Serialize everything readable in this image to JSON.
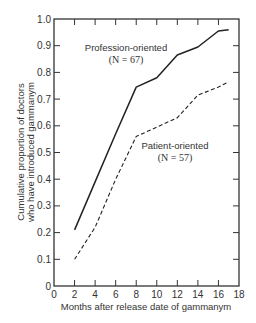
{
  "chart_data": {
    "type": "line",
    "title": "",
    "xlabel": "Months after release date of gammanym",
    "ylabel_lines": [
      "Cumulative proportion of doctors",
      "who have introduced gammanym"
    ],
    "ylabel": "Cumulative proportion of doctors who have introduced gammanym",
    "xlim": [
      0,
      18
    ],
    "ylim": [
      0,
      1.0
    ],
    "xticks": [
      0,
      2,
      4,
      6,
      8,
      10,
      12,
      14,
      16,
      18
    ],
    "xtick_labels": [
      "0",
      "2",
      "4",
      "6",
      "8",
      "10",
      "12",
      "14",
      "16",
      "18"
    ],
    "yticks": [
      0,
      0.1,
      0.2,
      0.3,
      0.4,
      0.5,
      0.6,
      0.7,
      0.8,
      0.9,
      1.0
    ],
    "ytick_labels": [
      "0",
      "0.1",
      "0.2",
      "0.3",
      "0.4",
      "0.5",
      "0.6",
      "0.7",
      "0.8",
      "0.9",
      "1.0"
    ],
    "grid": false,
    "legend": "inline labels",
    "series": [
      {
        "name": "Profession-oriented",
        "n_label": "(N = 67)",
        "style": "solid",
        "x": [
          2,
          4,
          6,
          8,
          10,
          12,
          14,
          16,
          17
        ],
        "values": [
          0.21,
          0.39,
          0.57,
          0.745,
          0.78,
          0.865,
          0.895,
          0.955,
          0.96
        ]
      },
      {
        "name": "Patient-oriented",
        "n_label": "(N = 57)",
        "style": "dashed",
        "x": [
          2,
          4,
          6,
          8,
          10,
          12,
          14,
          16,
          17
        ],
        "values": [
          0.1,
          0.22,
          0.4,
          0.56,
          0.595,
          0.63,
          0.715,
          0.745,
          0.765
        ]
      }
    ]
  }
}
